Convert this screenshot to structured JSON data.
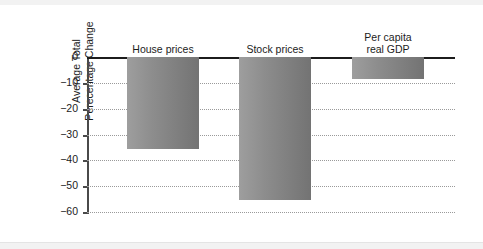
{
  "chart_data": {
    "type": "bar",
    "title": "",
    "subtitle": "",
    "xlabel": "",
    "ylabel": "Average Total\nPerecentage Change",
    "ylabel_lines": [
      "Average Total",
      "Perecentage Change"
    ],
    "categories": [
      "House prices",
      "Stock prices",
      "Per capita real GDP"
    ],
    "category_labels": [
      "House prices",
      "Stock prices",
      "Per capita\nreal GDP"
    ],
    "values": [
      -35.5,
      -55.5,
      -8.7
    ],
    "ylim": [
      -60,
      0
    ],
    "ytick_labels": [
      "0",
      "−10",
      "−20",
      "−30",
      "−40",
      "−50",
      "−60"
    ],
    "ytick_values": [
      0,
      -10,
      -20,
      -30,
      -40,
      -50,
      -60
    ],
    "grid": true,
    "grid_style": "dotted",
    "legend": "none",
    "orientation": "vertical",
    "bar_color": "#8d8d8d",
    "axis_color": "#1c1c1c",
    "grid_color": "#9a9a9a",
    "background_color": "#ffffff"
  },
  "bars": [
    {
      "label": "House prices",
      "label_lines": "House prices",
      "value": -35.5,
      "left": 40,
      "width": 72
    },
    {
      "label": "Stock prices",
      "label_lines": "Stock prices",
      "value": -55.5,
      "left": 152,
      "width": 72
    },
    {
      "label": "Per capita real GDP",
      "label_lines": "Per capita\nreal GDP",
      "value": -8.7,
      "left": 265,
      "width": 72
    }
  ],
  "ticks": [
    {
      "label": "0",
      "value": 0
    },
    {
      "label": "−10",
      "value": -10
    },
    {
      "label": "−20",
      "value": -20
    },
    {
      "label": "−30",
      "value": -30
    },
    {
      "label": "−40",
      "value": -40
    },
    {
      "label": "−50",
      "value": -50
    },
    {
      "label": "−60",
      "value": -60
    }
  ]
}
